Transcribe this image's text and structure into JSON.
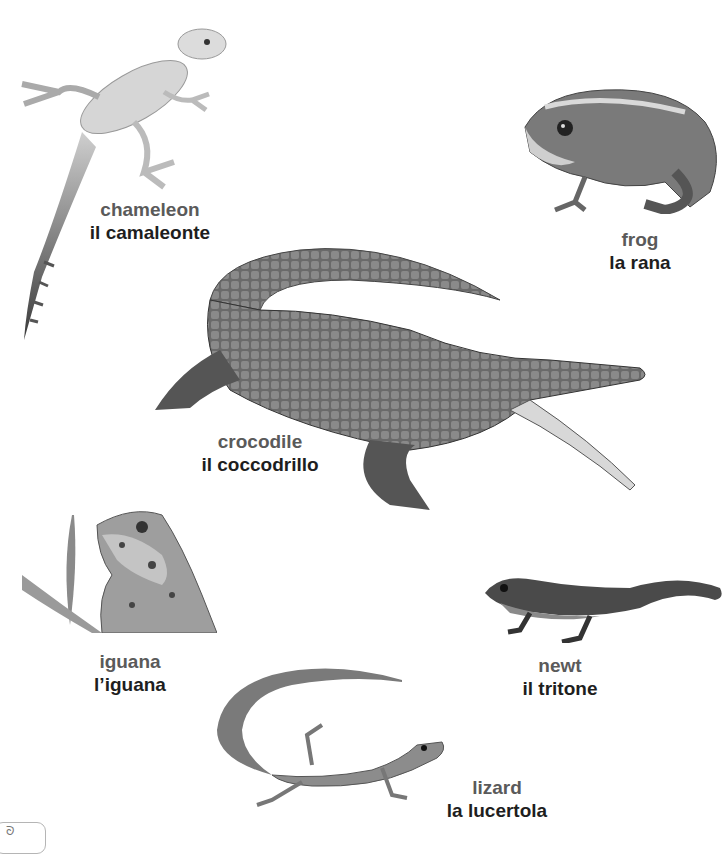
{
  "page": {
    "background": "#ffffff",
    "english_color": "#5a5a5a",
    "italian_color": "#1e1e1e",
    "page_marker": "ᘐ"
  },
  "entries": [
    {
      "id": "chameleon",
      "english": "chameleon",
      "italian": "il camaleonte"
    },
    {
      "id": "frog",
      "english": "frog",
      "italian": "la rana"
    },
    {
      "id": "crocodile",
      "english": "crocodile",
      "italian": "il coccodrillo"
    },
    {
      "id": "iguana",
      "english": "iguana",
      "italian": "l’iguana"
    },
    {
      "id": "newt",
      "english": "newt",
      "italian": "il tritone"
    },
    {
      "id": "lizard",
      "english": "lizard",
      "italian": "la lucertola"
    }
  ]
}
